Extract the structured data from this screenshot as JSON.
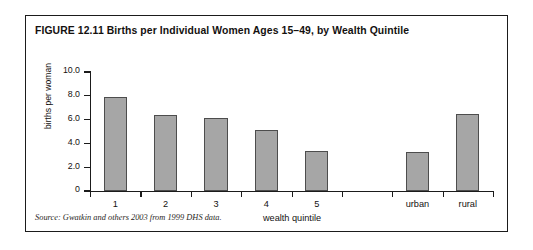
{
  "figure": {
    "title": "FIGURE 12.11  Births per Individual Women Ages 15–49, by Wealth Quintile",
    "source": "Source: Gwatkin and others 2003 from 1999 DHS data.",
    "border_color": "#1b1b1b",
    "background": "#ffffff"
  },
  "chart_data": {
    "type": "bar",
    "title": "FIGURE 12.11  Births per Individual Women Ages 15–49, by Wealth Quintile",
    "xlabel": "wealth quintile",
    "ylabel": "births per woman",
    "categories": [
      "1",
      "2",
      "3",
      "4",
      "5",
      "",
      "urban",
      "rural"
    ],
    "values": [
      7.9,
      6.4,
      6.1,
      5.1,
      3.4,
      null,
      3.3,
      6.5
    ],
    "ylim": [
      0,
      10
    ],
    "yticks": [
      0,
      2.0,
      4.0,
      6.0,
      8.0,
      10.0
    ],
    "ytick_labels": [
      "0",
      "2.0",
      "4.0",
      "6.0",
      "8.0",
      "10.0"
    ],
    "grid": false,
    "legend": null,
    "bar_color": "#a6a6a6",
    "bar_edge_color": "#4d4d4d",
    "axis_color": "#1b1b1b"
  }
}
